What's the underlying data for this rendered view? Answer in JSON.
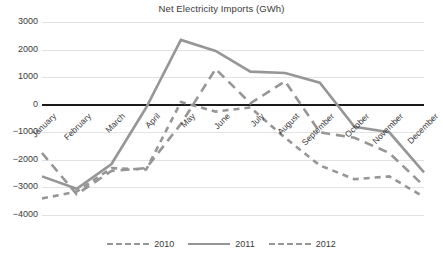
{
  "chart_data": {
    "type": "line",
    "title": "Net Electricity Imports (GWh)",
    "xlabel": "",
    "ylabel": "",
    "ylim": [
      -4000,
      3000
    ],
    "ystep": 1000,
    "grid": true,
    "legend_position": "bottom",
    "categories": [
      "January",
      "February",
      "March",
      "April",
      "May",
      "June",
      "July",
      "August",
      "September",
      "October",
      "November",
      "December"
    ],
    "ytick_labels": [
      "3000",
      "2000",
      "1000",
      "0",
      "−1000",
      "−2000",
      "−3000",
      "−4000"
    ],
    "ytick_values": [
      3000,
      2000,
      1000,
      0,
      -1000,
      -2000,
      -3000,
      -4000
    ],
    "series": [
      {
        "name": "2010",
        "style": "long-dash",
        "color": "#969696",
        "values": [
          -1750,
          -3250,
          -2400,
          -2300,
          -700,
          1300,
          50,
          850,
          -1000,
          -1200,
          -1750,
          -2950
        ]
      },
      {
        "name": "2011",
        "style": "solid",
        "color": "#969696",
        "values": [
          -2600,
          -3050,
          -2150,
          -100,
          2350,
          1950,
          1200,
          1150,
          800,
          -800,
          -1000,
          -2450
        ]
      },
      {
        "name": "2012",
        "style": "dash",
        "color": "#969696",
        "values": [
          -3400,
          -3150,
          -2300,
          -2350,
          100,
          -250,
          -100,
          -1200,
          -2200,
          -2700,
          -2600,
          -3350
        ]
      }
    ]
  }
}
